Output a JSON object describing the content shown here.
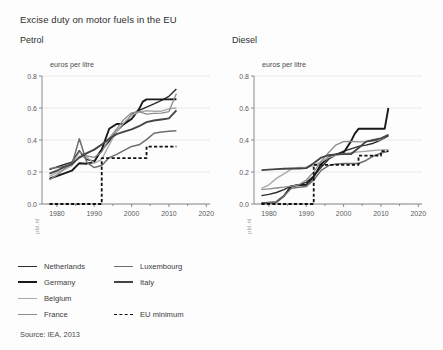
{
  "figure": {
    "title": "Excise duty on motor fuels in the EU",
    "source": "Source: IEA, 2013",
    "watermark": "pbl.nl"
  },
  "legend": {
    "columns": [
      [
        {
          "label": "Netherlands",
          "color": "#2b2b2b",
          "width": 1.4,
          "dash": false
        },
        {
          "label": "Germany",
          "color": "#1a1a1a",
          "width": 1.9,
          "dash": false
        },
        {
          "label": "Belgium",
          "color": "#aaaaaa",
          "width": 1.4,
          "dash": false
        },
        {
          "label": "France",
          "color": "#8c8c8c",
          "width": 1.3,
          "dash": false
        }
      ],
      [
        {
          "label": "Luxembourg",
          "color": "#6e6e6e",
          "width": 1.5,
          "dash": false
        },
        {
          "label": "Italy",
          "color": "#454545",
          "width": 1.9,
          "dash": false
        },
        {
          "label": "",
          "color": "transparent",
          "width": 0,
          "dash": false
        },
        {
          "label": "EU minimum",
          "color": "#111111",
          "width": 1.8,
          "dash": true
        }
      ]
    ]
  },
  "chart_data": [
    {
      "type": "line",
      "title": "Petrol",
      "xlabel": "",
      "ylabel": "euros per litre",
      "unit_label": "euros per litre",
      "xlim": [
        1976,
        2021
      ],
      "ylim": [
        0.0,
        0.8
      ],
      "xticks": [
        1980,
        1990,
        2000,
        2010,
        2020
      ],
      "xticklabels": [
        "1980",
        "1990",
        "2000",
        "2010",
        "2020"
      ],
      "yticks": [
        0.0,
        0.2,
        0.4,
        0.6,
        0.8
      ],
      "yticklabels": [
        "0.0",
        "0.2",
        "0.4",
        "0.6",
        "0.8"
      ],
      "grid": "horizontal",
      "legend_position": "below",
      "series": [
        {
          "name": "Netherlands",
          "color": "#2b2b2b",
          "width": 1.4,
          "dash": false,
          "x": [
            1978,
            1980,
            1982,
            1984,
            1986,
            1987,
            1988,
            1990,
            1991,
            1992,
            1994,
            1996,
            1998,
            2000,
            2002,
            2004,
            2006,
            2008,
            2010,
            2012
          ],
          "y": [
            0.215,
            0.232,
            0.247,
            0.262,
            0.333,
            0.3,
            0.278,
            0.268,
            0.3,
            0.337,
            0.392,
            0.455,
            0.5,
            0.559,
            0.585,
            0.606,
            0.626,
            0.647,
            0.673,
            0.719
          ]
        },
        {
          "name": "Germany",
          "color": "#1a1a1a",
          "width": 1.9,
          "dash": false,
          "x": [
            1978,
            1980,
            1982,
            1984,
            1986,
            1988,
            1990,
            1991,
            1992,
            1994,
            1996,
            1998,
            2000,
            2002,
            2003,
            2004,
            2006,
            2008,
            2010,
            2012
          ],
          "y": [
            0.159,
            0.175,
            0.192,
            0.208,
            0.255,
            0.252,
            0.262,
            0.307,
            0.34,
            0.47,
            0.5,
            0.501,
            0.531,
            0.593,
            0.64,
            0.654,
            0.654,
            0.654,
            0.654,
            0.655
          ]
        },
        {
          "name": "Belgium",
          "color": "#aaaaaa",
          "width": 1.4,
          "dash": false,
          "x": [
            1978,
            1980,
            1982,
            1984,
            1986,
            1988,
            1990,
            1992,
            1994,
            1996,
            1998,
            2000,
            2002,
            2004,
            2006,
            2008,
            2010,
            2012
          ],
          "y": [
            0.172,
            0.196,
            0.214,
            0.24,
            0.299,
            0.292,
            0.255,
            0.279,
            0.37,
            0.455,
            0.51,
            0.555,
            0.575,
            0.583,
            0.58,
            0.58,
            0.595,
            0.6
          ]
        },
        {
          "name": "France",
          "color": "#8c8c8c",
          "width": 1.3,
          "dash": false,
          "x": [
            1978,
            1980,
            1982,
            1984,
            1986,
            1988,
            1990,
            1992,
            1994,
            1996,
            1998,
            2000,
            2002,
            2004,
            2006,
            2008,
            2010,
            2012
          ],
          "y": [
            0.15,
            0.182,
            0.22,
            0.252,
            0.325,
            0.3,
            0.292,
            0.325,
            0.41,
            0.47,
            0.53,
            0.57,
            0.578,
            0.562,
            0.566,
            0.568,
            0.578,
            0.69
          ]
        },
        {
          "name": "Luxembourg",
          "color": "#6e6e6e",
          "width": 1.5,
          "dash": false,
          "x": [
            1978,
            1980,
            1982,
            1984,
            1986,
            1988,
            1990,
            1992,
            1994,
            1996,
            1998,
            2000,
            2002,
            2004,
            2006,
            2008,
            2010,
            2012
          ],
          "y": [
            0.22,
            0.228,
            0.235,
            0.246,
            0.408,
            0.26,
            0.228,
            0.24,
            0.29,
            0.31,
            0.335,
            0.36,
            0.37,
            0.402,
            0.442,
            0.45,
            0.455,
            0.458
          ]
        },
        {
          "name": "Italy",
          "color": "#454545",
          "width": 1.9,
          "dash": false,
          "x": [
            1978,
            1980,
            1982,
            1984,
            1986,
            1988,
            1990,
            1992,
            1994,
            1996,
            1998,
            2000,
            2002,
            2004,
            2006,
            2008,
            2010,
            2012
          ],
          "y": [
            0.19,
            0.208,
            0.232,
            0.25,
            0.29,
            0.318,
            0.34,
            0.372,
            0.408,
            0.437,
            0.452,
            0.466,
            0.486,
            0.512,
            0.522,
            0.528,
            0.535,
            0.585
          ]
        },
        {
          "name": "EU minimum",
          "color": "#111111",
          "width": 1.8,
          "dash": true,
          "x": [
            1978,
            1992,
            1992,
            2004,
            2004,
            2012
          ],
          "y": [
            0.0,
            0.0,
            0.287,
            0.287,
            0.359,
            0.359
          ]
        }
      ]
    },
    {
      "type": "line",
      "title": "Diesel",
      "xlabel": "",
      "ylabel": "euros per litre",
      "unit_label": "euros per litre",
      "xlim": [
        1976,
        2021
      ],
      "ylim": [
        0.0,
        0.8
      ],
      "xticks": [
        1980,
        1990,
        2000,
        2010,
        2020
      ],
      "xticklabels": [
        "1980",
        "1990",
        "2000",
        "2010",
        "2020"
      ],
      "yticks": [
        0.0,
        0.2,
        0.4,
        0.6,
        0.8
      ],
      "yticklabels": [
        "0.0",
        "0.2",
        "0.4",
        "0.6",
        "0.8"
      ],
      "grid": "horizontal",
      "legend_position": "below",
      "series": [
        {
          "name": "Netherlands",
          "color": "#2b2b2b",
          "width": 1.4,
          "dash": false,
          "x": [
            1978,
            1980,
            1982,
            1984,
            1986,
            1988,
            1990,
            1992,
            1994,
            1996,
            1998,
            2000,
            2002,
            2004,
            2006,
            2008,
            2010,
            2012
          ],
          "y": [
            0.052,
            0.06,
            0.072,
            0.09,
            0.112,
            0.12,
            0.135,
            0.175,
            0.23,
            0.28,
            0.308,
            0.33,
            0.345,
            0.36,
            0.368,
            0.38,
            0.4,
            0.425
          ]
        },
        {
          "name": "Germany",
          "color": "#1a1a1a",
          "width": 1.9,
          "dash": false,
          "x": [
            1978,
            1980,
            1982,
            1984,
            1986,
            1988,
            1990,
            1992,
            1994,
            1996,
            1998,
            2000,
            2002,
            2003,
            2004,
            2006,
            2008,
            2010,
            2011,
            2012
          ],
          "y": [
            0.005,
            0.008,
            0.012,
            0.05,
            0.112,
            0.118,
            0.12,
            0.17,
            0.25,
            0.292,
            0.31,
            0.32,
            0.393,
            0.44,
            0.47,
            0.47,
            0.47,
            0.47,
            0.47,
            0.6
          ]
        },
        {
          "name": "Belgium",
          "color": "#aaaaaa",
          "width": 1.4,
          "dash": false,
          "x": [
            1978,
            1980,
            1982,
            1984,
            1986,
            1988,
            1990,
            1992,
            1994,
            1996,
            1998,
            2000,
            2002,
            2004,
            2006,
            2008,
            2010,
            2012
          ],
          "y": [
            0.098,
            0.12,
            0.16,
            0.188,
            0.218,
            0.228,
            0.228,
            0.24,
            0.265,
            0.29,
            0.305,
            0.315,
            0.32,
            0.326,
            0.33,
            0.334,
            0.338,
            0.34
          ]
        },
        {
          "name": "France",
          "color": "#8c8c8c",
          "width": 1.3,
          "dash": false,
          "x": [
            1978,
            1980,
            1982,
            1984,
            1986,
            1988,
            1990,
            1992,
            1994,
            1996,
            1998,
            2000,
            2002,
            2004,
            2006,
            2008,
            2010,
            2012
          ],
          "y": [
            0.09,
            0.095,
            0.1,
            0.105,
            0.112,
            0.12,
            0.15,
            0.2,
            0.268,
            0.322,
            0.37,
            0.39,
            0.392,
            0.388,
            0.39,
            0.395,
            0.4,
            0.435
          ]
        },
        {
          "name": "Luxembourg",
          "color": "#6e6e6e",
          "width": 1.5,
          "dash": false,
          "x": [
            1978,
            1980,
            1982,
            1984,
            1986,
            1988,
            1990,
            1992,
            1994,
            1996,
            1998,
            2000,
            2002,
            2004,
            2006,
            2008,
            2010,
            2012
          ],
          "y": [
            0.005,
            0.008,
            0.01,
            0.05,
            0.098,
            0.105,
            0.11,
            0.15,
            0.21,
            0.24,
            0.25,
            0.253,
            0.253,
            0.253,
            0.272,
            0.3,
            0.318,
            0.33
          ]
        },
        {
          "name": "Italy",
          "color": "#454545",
          "width": 1.9,
          "dash": false,
          "x": [
            1978,
            1980,
            1982,
            1984,
            1986,
            1988,
            1990,
            1992,
            1994,
            1996,
            1998,
            2000,
            2002,
            2004,
            2006,
            2008,
            2010,
            2012
          ],
          "y": [
            0.212,
            0.215,
            0.218,
            0.22,
            0.222,
            0.222,
            0.224,
            0.255,
            0.29,
            0.305,
            0.31,
            0.312,
            0.312,
            0.35,
            0.39,
            0.4,
            0.41,
            0.432
          ]
        },
        {
          "name": "EU minimum",
          "color": "#111111",
          "width": 1.8,
          "dash": true,
          "x": [
            1978,
            1992,
            1992,
            2004,
            2004,
            2010,
            2010,
            2012
          ],
          "y": [
            0.0,
            0.0,
            0.245,
            0.245,
            0.302,
            0.302,
            0.33,
            0.33
          ]
        }
      ]
    }
  ]
}
